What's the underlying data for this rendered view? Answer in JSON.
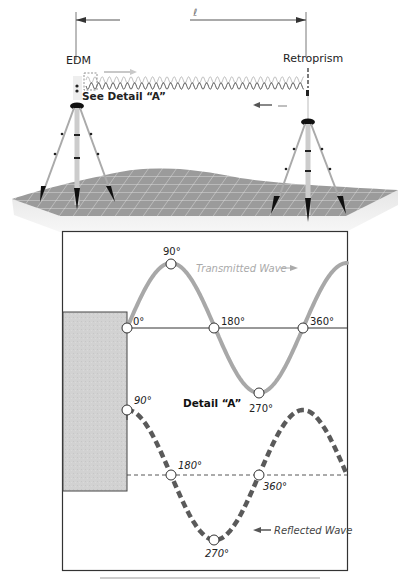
{
  "figure": {
    "top_scene": {
      "distance_label": "ℓ",
      "edm_label": "EDM",
      "retroprism_label": "Retroprism",
      "see_detail_label": "See Detail “A”"
    },
    "detail": {
      "title": "Detail “A”",
      "transmitted_wave_label": "Transmitted Wave",
      "reflected_wave_label": "Reflected Wave",
      "transmitted_points": [
        {
          "label": "0°"
        },
        {
          "label": "90°"
        },
        {
          "label": "180°"
        },
        {
          "label": "270°"
        },
        {
          "label": "360°"
        }
      ],
      "reflected_points": [
        {
          "label": "90°"
        },
        {
          "label": "180°"
        },
        {
          "label": "270°"
        },
        {
          "label": "360°"
        }
      ]
    },
    "colors": {
      "transmitted_wave": "#a8a8a8",
      "reflected_wave": "#5a5a5a",
      "terrain": "#9a9a9a",
      "grid": "#e6e6e6",
      "box_border": "#333333",
      "instrument_fill": "#d0d0d0"
    }
  }
}
